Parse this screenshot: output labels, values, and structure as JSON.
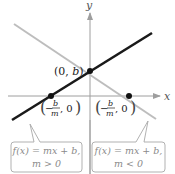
{
  "axes": {
    "x_label": "x",
    "y_label": "y"
  },
  "lines": {
    "increasing": {
      "color": "#1a1a1a",
      "slope_sign": "positive"
    },
    "decreasing": {
      "color": "#bdbdbd",
      "slope_sign": "negative"
    }
  },
  "points": {
    "y_intercept": {
      "label_open": "(0, ",
      "label_var": "b",
      "label_close": ")"
    },
    "x_intercept_left": {
      "minus": "−",
      "num": "b",
      "den": "m",
      "rest": ", 0"
    },
    "x_intercept_right": {
      "minus": "−",
      "num": "b",
      "den": "m",
      "rest": ", 0"
    }
  },
  "callouts": {
    "left": {
      "line1": "f(x) = mx + b,",
      "line2": "m > 0"
    },
    "right": {
      "line1": "f(x) = mx + b,",
      "line2": "m < 0"
    }
  },
  "colors": {
    "axis": "#9e9e9e",
    "callout_border": "#a8a8a8",
    "callout_text": "#8a8a8a",
    "dot": "#111111"
  }
}
